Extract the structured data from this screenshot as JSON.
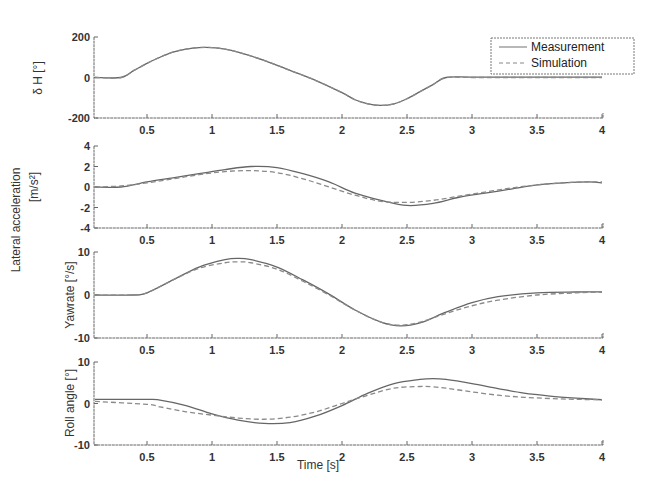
{
  "figure": {
    "xlabel": "Time [s]",
    "x_ticks": [
      "0.5",
      "1",
      "1.5",
      "2",
      "2.5",
      "3",
      "3.5",
      "4"
    ],
    "legend": [
      {
        "label": "Measurement",
        "style": "solid"
      },
      {
        "label": "Simulation",
        "style": "dashed"
      }
    ]
  },
  "chart_data": [
    {
      "type": "line",
      "title": "",
      "ylabel": "δ_H [°]",
      "xlabel": "",
      "xlim": [
        0.1,
        4
      ],
      "ylim": [
        -200,
        200
      ],
      "y_ticks": [
        "200",
        "0",
        "-200"
      ],
      "x": [
        0.1,
        0.3,
        0.4,
        0.5,
        0.6,
        0.7,
        0.8,
        0.9,
        1.0,
        1.1,
        1.2,
        1.4,
        1.6,
        1.8,
        2.0,
        2.1,
        2.2,
        2.3,
        2.4,
        2.5,
        2.6,
        2.7,
        2.8,
        3.0,
        3.5,
        4.0
      ],
      "series": [
        {
          "name": "Measurement",
          "values": [
            0,
            0,
            35,
            70,
            100,
            125,
            140,
            148,
            148,
            140,
            125,
            85,
            35,
            -15,
            -75,
            -110,
            -130,
            -138,
            -130,
            -105,
            -70,
            -35,
            0,
            2,
            2,
            2
          ]
        },
        {
          "name": "Simulation",
          "values": [
            0,
            0,
            35,
            70,
            100,
            125,
            140,
            148,
            148,
            140,
            125,
            85,
            35,
            -15,
            -75,
            -110,
            -130,
            -138,
            -130,
            -105,
            -70,
            -35,
            0,
            0,
            0,
            0
          ]
        }
      ],
      "legend_position": "upper right",
      "grid": false
    },
    {
      "type": "line",
      "ylabel": "Lateral acceleration [m/s²]",
      "xlabel": "",
      "xlim": [
        0.1,
        4
      ],
      "ylim": [
        -4,
        4
      ],
      "y_ticks": [
        "4",
        "2",
        "0",
        "-2",
        "-4"
      ],
      "x": [
        0.1,
        0.3,
        0.5,
        0.7,
        0.9,
        1.1,
        1.3,
        1.5,
        1.7,
        1.9,
        2.1,
        2.3,
        2.5,
        2.7,
        2.9,
        3.1,
        3.3,
        3.5,
        3.7,
        3.9,
        4.0
      ],
      "series": [
        {
          "name": "Measurement",
          "values": [
            0,
            0,
            0.5,
            0.9,
            1.3,
            1.7,
            2.0,
            1.9,
            1.3,
            0.5,
            -0.6,
            -1.3,
            -1.8,
            -1.6,
            -1.0,
            -0.6,
            -0.2,
            0.2,
            0.4,
            0.5,
            0.4
          ]
        },
        {
          "name": "Simulation",
          "values": [
            0,
            0.1,
            0.4,
            0.8,
            1.2,
            1.5,
            1.6,
            1.4,
            0.8,
            0.0,
            -0.8,
            -1.4,
            -1.5,
            -1.3,
            -0.9,
            -0.5,
            -0.1,
            0.2,
            0.4,
            0.5,
            0.5
          ]
        }
      ],
      "grid": false
    },
    {
      "type": "line",
      "ylabel": "Yawrate [°/s]",
      "xlabel": "",
      "xlim": [
        0.1,
        4
      ],
      "ylim": [
        -10,
        10
      ],
      "y_ticks": [
        "10",
        "0",
        "-10"
      ],
      "x": [
        0.1,
        0.4,
        0.5,
        0.7,
        0.9,
        1.1,
        1.2,
        1.3,
        1.5,
        1.7,
        1.9,
        2.1,
        2.3,
        2.45,
        2.6,
        2.8,
        3.0,
        3.2,
        3.5,
        3.8,
        4.0
      ],
      "series": [
        {
          "name": "Measurement",
          "values": [
            0,
            0,
            0.5,
            3.5,
            6.5,
            8.2,
            8.5,
            8.2,
            6.5,
            3.5,
            0.2,
            -3.5,
            -6.3,
            -7.2,
            -6.5,
            -4.0,
            -1.8,
            -0.4,
            0.5,
            0.7,
            0.7
          ]
        },
        {
          "name": "Simulation",
          "values": [
            0,
            0,
            0.5,
            3.5,
            6.2,
            7.5,
            7.7,
            7.5,
            6.0,
            3.2,
            0,
            -3.5,
            -6.3,
            -7.0,
            -6.3,
            -4.3,
            -2.5,
            -1.2,
            0,
            0.5,
            0.7
          ]
        }
      ],
      "grid": false
    },
    {
      "type": "line",
      "ylabel": "Roll angle [°]",
      "xlabel": "Time [s]",
      "xlim": [
        0.1,
        4
      ],
      "ylim": [
        -10,
        10
      ],
      "y_ticks": [
        "10",
        "0",
        "-10"
      ],
      "x": [
        0.1,
        0.5,
        0.6,
        0.8,
        1.0,
        1.2,
        1.4,
        1.6,
        1.8,
        2.0,
        2.2,
        2.4,
        2.6,
        2.7,
        2.8,
        3.0,
        3.2,
        3.4,
        3.6,
        3.8,
        4.0
      ],
      "series": [
        {
          "name": "Measurement",
          "values": [
            1.0,
            1.0,
            0.8,
            -0.5,
            -2.5,
            -4.0,
            -4.8,
            -4.6,
            -3.0,
            -0.5,
            2.5,
            4.8,
            5.8,
            6.0,
            5.8,
            4.8,
            3.6,
            2.5,
            1.8,
            1.3,
            0.9
          ]
        },
        {
          "name": "Simulation",
          "values": [
            0.5,
            -0.2,
            -0.8,
            -2.0,
            -2.8,
            -3.5,
            -3.8,
            -3.3,
            -2.0,
            0.0,
            2.0,
            3.7,
            4.1,
            4.0,
            3.7,
            2.8,
            2.0,
            1.5,
            1.2,
            1.0,
            0.9
          ]
        }
      ],
      "grid": false
    }
  ]
}
